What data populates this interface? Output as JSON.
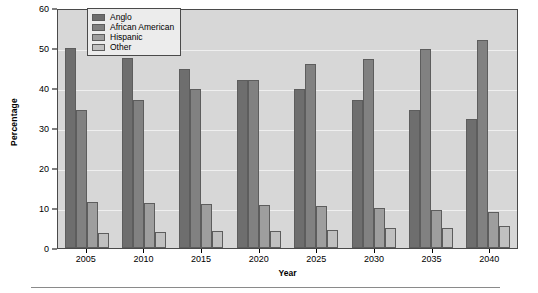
{
  "chart_data": {
    "type": "bar",
    "title": "",
    "xlabel": "Year",
    "ylabel": "Percentage",
    "categories": [
      "2005",
      "2010",
      "2015",
      "2020",
      "2025",
      "2030",
      "2035",
      "2040"
    ],
    "series": [
      {
        "name": "Anglo",
        "color": "#6e6e6e",
        "values": [
          50.0,
          47.5,
          44.8,
          42.0,
          39.7,
          37.0,
          34.5,
          32.2
        ]
      },
      {
        "name": "African American",
        "color": "#818181",
        "values": [
          34.5,
          37.0,
          39.7,
          42.0,
          46.0,
          47.2,
          49.8,
          52.0
        ]
      },
      {
        "name": "Hispanic",
        "color": "#9e9e9e",
        "values": [
          11.5,
          11.2,
          11.0,
          10.7,
          10.4,
          10.1,
          9.6,
          9.1
        ]
      },
      {
        "name": "Other",
        "color": "#c0c0c0",
        "values": [
          3.7,
          4.0,
          4.2,
          4.3,
          4.6,
          4.9,
          5.1,
          5.4
        ]
      }
    ],
    "ylim": [
      0,
      60
    ],
    "yticks": [
      "0",
      "10",
      "20",
      "30",
      "40",
      "50",
      "60"
    ],
    "grid": true,
    "legend_position": "top-left-inside"
  },
  "axes": {
    "y_title": "Percentage",
    "x_title": "Year"
  },
  "legend": {
    "entries": [
      {
        "label": "Anglo"
      },
      {
        "label": "African American"
      },
      {
        "label": "Hispanic"
      },
      {
        "label": "Other"
      }
    ]
  }
}
